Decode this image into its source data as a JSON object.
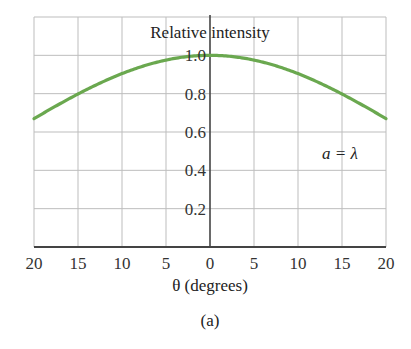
{
  "chart_data": {
    "type": "line",
    "title": "Relative intensity",
    "xlabel": "θ (degrees)",
    "ylabel": "Relative intensity",
    "caption": "(a)",
    "annotation": "a = λ",
    "x_tick_labels": [
      "20",
      "15",
      "10",
      "5",
      "0",
      "5",
      "10",
      "15",
      "20"
    ],
    "x_ticks": [
      -20,
      -15,
      -10,
      -5,
      0,
      5,
      10,
      15,
      20
    ],
    "y_tick_labels": [
      "0.2",
      "0.4",
      "0.6",
      "0.8",
      "1.0"
    ],
    "y_ticks": [
      0.2,
      0.4,
      0.6,
      0.8,
      1.0
    ],
    "xlim": [
      -20,
      20
    ],
    "ylim": [
      0,
      1.2
    ],
    "grid": true,
    "series": [
      {
        "name": "a = λ",
        "color": "#6aa84f",
        "x": [
          -20,
          -17.5,
          -15,
          -12.5,
          -10,
          -7.5,
          -5,
          -2.5,
          0,
          2.5,
          5,
          7.5,
          10,
          12.5,
          15,
          17.5,
          20
        ],
        "values": [
          0.67,
          0.74,
          0.8,
          0.86,
          0.91,
          0.95,
          0.98,
          0.99,
          1.0,
          0.99,
          0.98,
          0.95,
          0.91,
          0.86,
          0.8,
          0.74,
          0.67
        ]
      }
    ]
  },
  "colors": {
    "curve": "#6aa84f",
    "grid": "#bdbdbd",
    "axis": "#444444"
  }
}
